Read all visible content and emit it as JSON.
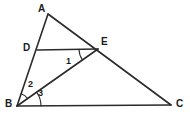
{
  "figure": {
    "kind": "geometry-diagram",
    "canvas": {
      "width": 190,
      "height": 118,
      "background": "#ffffff"
    },
    "style": {
      "stroke_color": "#2b2b2b",
      "stroke_width": 1.6,
      "arc_stroke_width": 1.1,
      "label_color": "#1b1b1b"
    },
    "points": [
      {
        "id": "A",
        "label": "A",
        "x": 48,
        "y": 14,
        "label_x": 38,
        "label_y": 4
      },
      {
        "id": "B",
        "label": "B",
        "x": 17,
        "y": 106,
        "label_x": 5,
        "label_y": 99
      },
      {
        "id": "C",
        "label": "C",
        "x": 171,
        "y": 105,
        "label_x": 176,
        "label_y": 99
      },
      {
        "id": "D",
        "label": "D",
        "x": 37,
        "y": 50,
        "label_x": 23,
        "label_y": 43
      },
      {
        "id": "E",
        "label": "E",
        "x": 98,
        "y": 49,
        "label_x": 101,
        "label_y": 37
      }
    ],
    "segments": [
      {
        "id": "AB",
        "from": "A",
        "to": "B",
        "name": "segment-ab"
      },
      {
        "id": "AC",
        "from": "A",
        "to": "C",
        "name": "segment-ac"
      },
      {
        "id": "BC",
        "from": "B",
        "to": "C",
        "name": "segment-bc"
      },
      {
        "id": "DE",
        "from": "D",
        "to": "E",
        "name": "segment-de"
      },
      {
        "id": "BE",
        "from": "B",
        "to": "E",
        "name": "segment-be"
      }
    ],
    "angles": [
      {
        "id": "1",
        "label": "1",
        "vertex": "E",
        "between": [
          "D",
          "B"
        ],
        "label_x": 66,
        "label_y": 57,
        "arc_radius": 19
      },
      {
        "id": "2",
        "label": "2",
        "vertex": "B",
        "between": [
          "A",
          "E"
        ],
        "label_x": 28,
        "label_y": 80,
        "arc_radius": 13
      },
      {
        "id": "3",
        "label": "3",
        "vertex": "B",
        "between": [
          "E",
          "C"
        ],
        "label_x": 38,
        "label_y": 89,
        "arc_radius": 24
      }
    ]
  }
}
